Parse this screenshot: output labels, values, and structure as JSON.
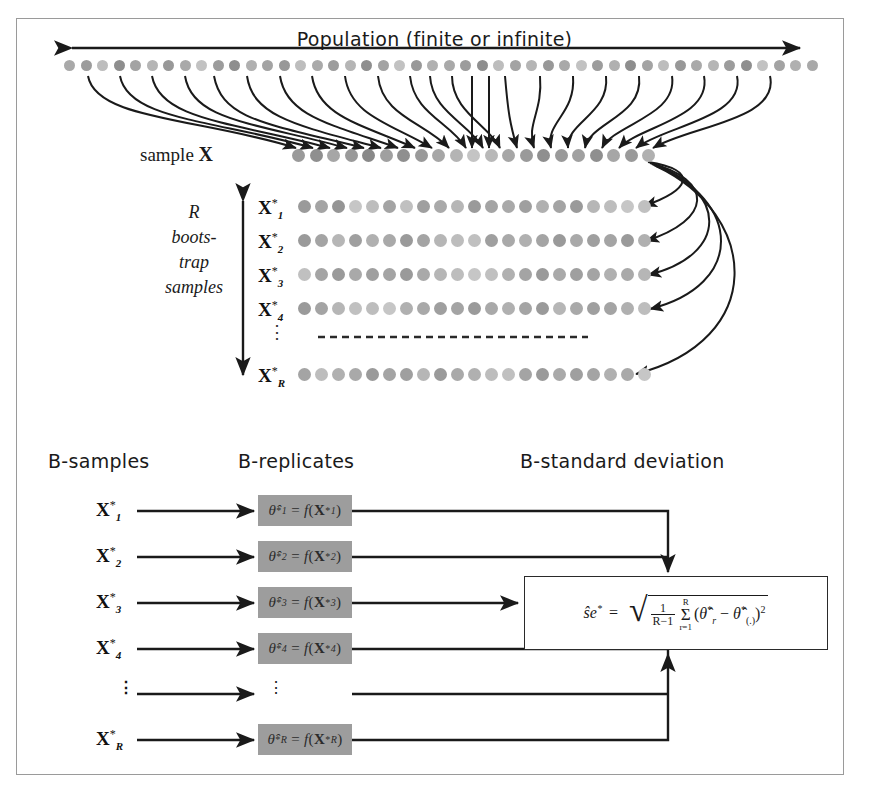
{
  "figure": {
    "frame_color": "#9a9a9a",
    "background": "#ffffff"
  },
  "population": {
    "title": "Population (finite or infinite)",
    "arrow": "double-headed-horizontal",
    "dot_count": 46,
    "dot_shades": [
      "#a9a9a9",
      "#9c9c9c",
      "#bdbdbd",
      "#8e8e8e",
      "#a3a3a3",
      "#b5b5b5",
      "#989898",
      "#a9a9a9",
      "#c2c2c2",
      "#9c9c9c",
      "#8e8e8e",
      "#b0b0b0",
      "#a3a3a3",
      "#989898",
      "#bdbdbd",
      "#a9a9a9",
      "#9c9c9c",
      "#b5b5b5",
      "#8e8e8e",
      "#a3a3a3",
      "#c2c2c2",
      "#989898",
      "#b0b0b0",
      "#a9a9a9",
      "#9c9c9c",
      "#8e8e8e",
      "#bdbdbd",
      "#a3a3a3",
      "#b5b5b5",
      "#989898",
      "#a9a9a9",
      "#c2c2c2",
      "#9c9c9c",
      "#b0b0b0",
      "#8e8e8e",
      "#a3a3a3",
      "#bdbdbd",
      "#989898",
      "#a9a9a9",
      "#b5b5b5",
      "#9c9c9c",
      "#8e8e8e",
      "#c2c2c2",
      "#a3a3a3",
      "#b0b0b0",
      "#a9a9a9"
    ]
  },
  "sample": {
    "label_text": "sample ",
    "label_symbol": "X",
    "dot_count": 21,
    "dot_shades": [
      "#9a9a9a",
      "#8f8f8f",
      "#a6a6a6",
      "#9a9a9a",
      "#898989",
      "#a0a0a0",
      "#8f8f8f",
      "#9a9a9a",
      "#a6a6a6",
      "#b4b4b4",
      "#c4c4c4",
      "#b8b8b8",
      "#a6a6a6",
      "#9a9a9a",
      "#8f8f8f",
      "#9a9a9a",
      "#a0a0a0",
      "#8f8f8f",
      "#a6a6a6",
      "#9a9a9a",
      "#b0b0b0"
    ]
  },
  "bootstrap_block": {
    "lines": [
      "R",
      "boots-",
      "trap",
      "samples"
    ],
    "bracket": "double-headed-vertical"
  },
  "bootstrap_rows": [
    {
      "label_base": "X",
      "label_sup": "*",
      "label_sub": "1",
      "dot_count": 21,
      "dot_shades": [
        "#9a9a9a",
        "#a4a4a4",
        "#959595",
        "#c6c6c6",
        "#bdbdbd",
        "#a4a4a4",
        "#c0c0c0",
        "#9f9f9f",
        "#a9a9a9",
        "#b6b6b6",
        "#9a9a9a",
        "#a4a4a4",
        "#a9a9a9",
        "#9f9f9f",
        "#b0b0b0",
        "#a4a4a4",
        "#9a9a9a",
        "#b6b6b6",
        "#bdbdbd",
        "#c6c6c6",
        "#c0c0c0"
      ]
    },
    {
      "label_base": "X",
      "label_sup": "*",
      "label_sub": "2",
      "dot_count": 21,
      "dot_shades": [
        "#9a9a9a",
        "#a4a4a4",
        "#b6b6b6",
        "#9f9f9f",
        "#b0b0b0",
        "#a9a9a9",
        "#9a9a9a",
        "#a4a4a4",
        "#b6b6b6",
        "#bdbdbd",
        "#c0c0c0",
        "#9f9f9f",
        "#a9a9a9",
        "#b0b0b0",
        "#a4a4a4",
        "#9a9a9a",
        "#a9a9a9",
        "#9f9f9f",
        "#a4a4a4",
        "#9a9a9a",
        "#b0b0b0"
      ]
    },
    {
      "label_base": "X",
      "label_sup": "*",
      "label_sub": "3",
      "dot_count": 21,
      "dot_shades": [
        "#c0c0c0",
        "#a4a4a4",
        "#9a9a9a",
        "#a9a9a9",
        "#9f9f9f",
        "#a4a4a4",
        "#9a9a9a",
        "#a9a9a9",
        "#b6b6b6",
        "#bdbdbd",
        "#c6c6c6",
        "#c0c0c0",
        "#b0b0b0",
        "#a4a4a4",
        "#9a9a9a",
        "#a9a9a9",
        "#9f9f9f",
        "#a4a4a4",
        "#b0b0b0",
        "#a9a9a9",
        "#b6b6b6"
      ]
    },
    {
      "label_base": "X",
      "label_sup": "*",
      "label_sub": "4",
      "dot_count": 21,
      "dot_shades": [
        "#9a9a9a",
        "#a4a4a4",
        "#b6b6b6",
        "#c0c0c0",
        "#bdbdbd",
        "#c6c6c6",
        "#b0b0b0",
        "#a9a9a9",
        "#9f9f9f",
        "#a4a4a4",
        "#9a9a9a",
        "#a9a9a9",
        "#b0b0b0",
        "#a4a4a4",
        "#9a9a9a",
        "#b6b6b6",
        "#a9a9a9",
        "#9f9f9f",
        "#a4a4a4",
        "#b0b0b0",
        "#bdbdbd"
      ]
    }
  ],
  "bootstrap_last_row": {
    "label_base": "X",
    "label_sup": "*",
    "label_sub": "R",
    "dot_count": 21,
    "dot_shades": [
      "#a4a4a4",
      "#bdbdbd",
      "#b0b0b0",
      "#a9a9a9",
      "#9a9a9a",
      "#a4a4a4",
      "#9f9f9f",
      "#b6b6b6",
      "#9a9a9a",
      "#a9a9a9",
      "#b0b0b0",
      "#bdbdbd",
      "#c0c0c0",
      "#a4a4a4",
      "#9a9a9a",
      "#a9a9a9",
      "#9f9f9f",
      "#a4a4a4",
      "#b0b0b0",
      "#a9a9a9",
      "#c6c6c6"
    ]
  },
  "separator": {
    "style": "dashed",
    "ellipsis": "⋮"
  },
  "lower_panel": {
    "headers": {
      "samples": "B-samples",
      "replicates": "B-replicates",
      "standard_deviation": "B-standard deviation"
    },
    "rows": [
      {
        "sample_base": "X",
        "sample_sup": "*",
        "sample_sub": "1",
        "replicate_theta": "θ̂",
        "replicate_sup": "*",
        "replicate_sub": "1",
        "replicate_text": "θ̂*₁ = f(X*₁)"
      },
      {
        "sample_base": "X",
        "sample_sup": "*",
        "sample_sub": "2",
        "replicate_theta": "θ̂",
        "replicate_sup": "*",
        "replicate_sub": "2",
        "replicate_text": "θ̂*₂ = f(X*₂)"
      },
      {
        "sample_base": "X",
        "sample_sup": "*",
        "sample_sub": "3",
        "replicate_theta": "θ̂",
        "replicate_sup": "*",
        "replicate_sub": "3",
        "replicate_text": "θ̂*₃ = f(X*₃)"
      },
      {
        "sample_base": "X",
        "sample_sup": "*",
        "sample_sub": "4",
        "replicate_theta": "θ̂",
        "replicate_sup": "*",
        "replicate_sub": "4",
        "replicate_text": "θ̂*₄ = f(X*₄)"
      },
      {
        "sample_base": "",
        "sample_sup": "",
        "sample_sub": "",
        "replicate_theta": "",
        "replicate_sup": "",
        "replicate_sub": "",
        "replicate_text": "⋮"
      },
      {
        "sample_base": "X",
        "sample_sup": "*",
        "sample_sub": "R",
        "replicate_theta": "θ̂",
        "replicate_sup": "*",
        "replicate_sub": "R",
        "replicate_text": "θ̂*_R = f(X*_R)"
      }
    ],
    "formula": {
      "lhs": "ŝe",
      "lhs_sup": "*",
      "equals": "=",
      "fraction_num": "1",
      "fraction_den": "R−1",
      "sum_top": "R",
      "sum_symbol": "Σ",
      "sum_bottom": "r=1",
      "term_open": "(",
      "term_theta_r": "θ̂",
      "term_theta_r_sup": "*",
      "term_theta_r_sub": "r",
      "term_minus": "−",
      "term_theta_dot": "θ̂",
      "term_theta_dot_sup": "*",
      "term_theta_dot_sub": "(.)",
      "term_close": ")",
      "term_power": "2",
      "full_text": "ŝe* = √( 1/(R−1) Σ_{r=1}^{R} (θ̂*_r − θ̂*_(.))² )"
    }
  },
  "colors": {
    "box_gray": "#9d9d9d",
    "line_black": "#1a1a1a",
    "frame_gray": "#9a9a9a"
  }
}
